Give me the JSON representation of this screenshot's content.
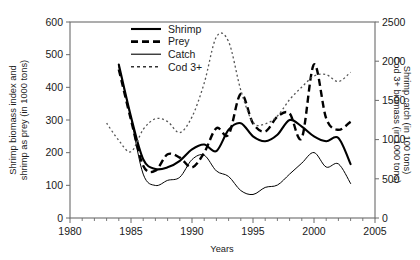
{
  "chart_data": {
    "type": "line",
    "title": "",
    "xlabel": "Years",
    "ylabel_left": "Shrimp biomass index and shrimp as prey (in 1000 tons)",
    "ylabel_right": "Shrimp catch (in 100 tons) Cod 3+ biomass (in 1000 tons)",
    "xlim": [
      1980,
      2005
    ],
    "ylim_left": [
      0,
      600
    ],
    "ylim_right": [
      0,
      2500
    ],
    "xticks": [
      1980,
      1985,
      1990,
      1995,
      2000,
      2005
    ],
    "xtick_labels": [
      "1980",
      "1985",
      "1990",
      "1995",
      "2000",
      "2005"
    ],
    "yticks_left": [
      0,
      100,
      200,
      300,
      400,
      500,
      600
    ],
    "ytick_labels_left": [
      "0",
      "100",
      "200",
      "300",
      "400",
      "500",
      "600"
    ],
    "yticks_right": [
      0,
      500,
      1000,
      1500,
      2000,
      2500
    ],
    "ytick_labels_right": [
      "0",
      "500",
      "1000",
      "1500",
      "2000",
      "2500"
    ],
    "xtick_minor_step": 1,
    "grid": false,
    "legend_position": "top-center",
    "series": [
      {
        "name": "Shrimp",
        "axis": "left",
        "style": "thick-solid",
        "x": [
          1984,
          1985,
          1986,
          1987,
          1988,
          1989,
          1990,
          1991,
          1992,
          1993,
          1994,
          1995,
          1996,
          1997,
          1998,
          1999,
          2000,
          2001,
          2002,
          2003
        ],
        "values": [
          470,
          310,
          180,
          150,
          155,
          175,
          210,
          225,
          205,
          270,
          290,
          250,
          235,
          255,
          300,
          280,
          250,
          235,
          245,
          165
        ]
      },
      {
        "name": "Prey",
        "axis": "left",
        "style": "thick-dashed",
        "x": [
          1984,
          1985,
          1986,
          1987,
          1988,
          1989,
          1990,
          1991,
          1992,
          1993,
          1994,
          1995,
          1996,
          1997,
          1998,
          1999,
          2000,
          2001,
          2002,
          2003
        ],
        "values": [
          455,
          300,
          160,
          145,
          195,
          185,
          155,
          200,
          275,
          255,
          380,
          290,
          265,
          310,
          320,
          245,
          470,
          305,
          270,
          295
        ]
      },
      {
        "name": "Catch",
        "axis": "right",
        "style": "thin-solid",
        "x": [
          1984,
          1985,
          1986,
          1987,
          1988,
          1989,
          1990,
          1991,
          1992,
          1993,
          1994,
          1995,
          1996,
          1997,
          1998,
          1999,
          2000,
          2001,
          2002,
          2003
        ],
        "values": [
          1930,
          1270,
          560,
          415,
          480,
          520,
          745,
          800,
          600,
          530,
          350,
          300,
          390,
          420,
          560,
          700,
          835,
          650,
          690,
          440
        ]
      },
      {
        "name": "Cod 3+",
        "axis": "right",
        "style": "dotted",
        "x": [
          1983,
          1984,
          1985,
          1986,
          1987,
          1988,
          1989,
          1990,
          1991,
          1992,
          1993,
          1994,
          1995,
          1996,
          1997,
          1998,
          1999,
          2000,
          2001,
          2002,
          2003
        ],
        "values": [
          1210,
          990,
          845,
          1130,
          1265,
          1230,
          1090,
          1290,
          1720,
          2310,
          2250,
          1630,
          1220,
          1200,
          1300,
          1510,
          1670,
          1810,
          1830,
          1740,
          1860
        ]
      }
    ]
  },
  "legend": {
    "items": [
      {
        "label": "Shrimp",
        "style": "thick-solid"
      },
      {
        "label": "Prey",
        "style": "thick-dashed"
      },
      {
        "label": "Catch",
        "style": "thin-solid"
      },
      {
        "label": "Cod 3+",
        "style": "dotted"
      }
    ]
  },
  "axes": {
    "x_title": "Years",
    "y_left_title_line1": "Shrimp biomass index and",
    "y_left_title_line2": "shrimp as prey (in 1000 tons)",
    "y_right_title_line1": "Shrimp catch (in 100 tons)",
    "y_right_title_line2": "Cod 3+ biomass (in 1000 tons)"
  },
  "colors": {
    "series_ink": "#000000",
    "cod_ink": "#555555",
    "axis": "#6b6b6b",
    "background": "#ffffff"
  }
}
